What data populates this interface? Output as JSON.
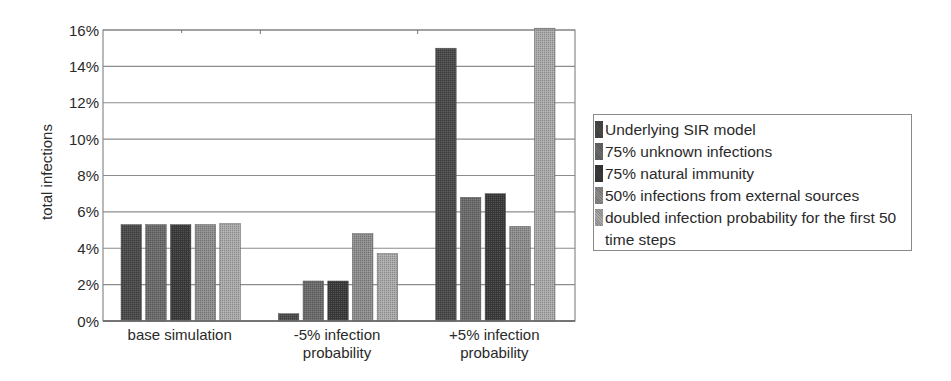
{
  "chart_data": {
    "type": "bar",
    "title": "",
    "xlabel": "",
    "ylabel": "total infections",
    "ylim": [
      0,
      16
    ],
    "yticks": [
      "0%",
      "2%",
      "4%",
      "6%",
      "8%",
      "10%",
      "12%",
      "14%",
      "16%"
    ],
    "grid": true,
    "legend_position": "right",
    "categories": [
      "base simulation",
      "-5% infection probability",
      "+5% infection probability"
    ],
    "category_label_lines": [
      [
        "base simulation"
      ],
      [
        "-5% infection",
        "probability"
      ],
      [
        "+5% infection",
        "probability"
      ]
    ],
    "series": [
      {
        "name": "Underlying SIR model",
        "color": "#4a4a4a",
        "values": [
          5.3,
          0.4,
          15.0
        ]
      },
      {
        "name": "75% unknown infections",
        "color": "#6b6b6b",
        "values": [
          5.3,
          2.2,
          6.8
        ]
      },
      {
        "name": "75% natural immunity",
        "color": "#3a3a3a",
        "values": [
          5.3,
          2.2,
          7.0
        ]
      },
      {
        "name": "50% infections from external sources",
        "color": "#8e8e8e",
        "values": [
          5.3,
          4.8,
          5.2
        ]
      },
      {
        "name": "doubled infection probability for the first 50 time steps",
        "color": "#ababab",
        "values": [
          5.35,
          3.7,
          16.1
        ]
      }
    ]
  },
  "legend": {
    "items": [
      {
        "label": "Underlying SIR model"
      },
      {
        "label": "75% unknown infections"
      },
      {
        "label": "75% natural immunity"
      },
      {
        "label": "50% infections from external sources"
      },
      {
        "label": "doubled infection probability for the first 50 time steps"
      }
    ]
  }
}
